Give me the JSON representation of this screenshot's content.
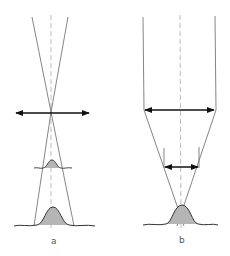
{
  "diagram": {
    "colors": {
      "line": "#666666",
      "arrow": "#111111",
      "dashed_axis": "#aaaaaa",
      "profile_fill": "#b5b5b5",
      "profile_stroke": "#333333"
    },
    "panels": [
      {
        "id": "a",
        "label": "a",
        "elements": [
          "converging cone lines",
          "focal-plane double arrow",
          "small gaussian profile",
          "large gaussian profile",
          "dashed optical axis"
        ]
      },
      {
        "id": "b",
        "label": "b",
        "elements": [
          "parallel beam lines",
          "wide double arrow",
          "narrow double arrow",
          "converging lines",
          "gaussian profile",
          "dashed optical axis"
        ]
      }
    ]
  }
}
